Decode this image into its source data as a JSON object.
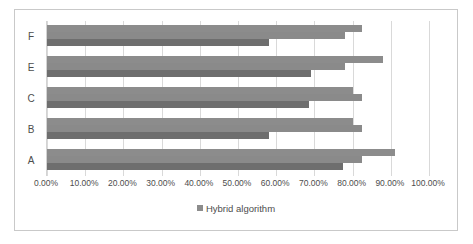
{
  "chart_data": {
    "type": "bar",
    "orientation": "horizontal",
    "title": "",
    "xlabel": "",
    "ylabel": "",
    "xlim": [
      0,
      100
    ],
    "grid": true,
    "legend_position": "bottom",
    "categories": [
      "A",
      "B",
      "C",
      "E",
      "F"
    ],
    "display_order_top_to_bottom": [
      "F",
      "E",
      "C",
      "B",
      "A"
    ],
    "tick_labels": [
      "0.00%",
      "10.00%",
      "20.00%",
      "30.00%",
      "40.00%",
      "50.00%",
      "60.00%",
      "70.00%",
      "80.00%",
      "90.00%",
      "100.00%"
    ],
    "tick_values": [
      0,
      10,
      20,
      30,
      40,
      50,
      60,
      70,
      80,
      90,
      100
    ],
    "legend": [
      "Hybrid algorithm"
    ],
    "series": [
      {
        "name": "series-1",
        "color": "#8c8c8c",
        "values": [
          91.0,
          80.0,
          80.0,
          88.0,
          82.5
        ]
      },
      {
        "name": "series-2",
        "color": "#8a8a8a",
        "values": [
          82.5,
          82.5,
          82.5,
          78.0,
          78.0
        ]
      },
      {
        "name": "Hybrid algorithm",
        "color": "#6e6e6e",
        "values": [
          77.5,
          58.0,
          68.5,
          69.0,
          58.0
        ]
      }
    ]
  },
  "legend_label": "Hybrid algorithm"
}
